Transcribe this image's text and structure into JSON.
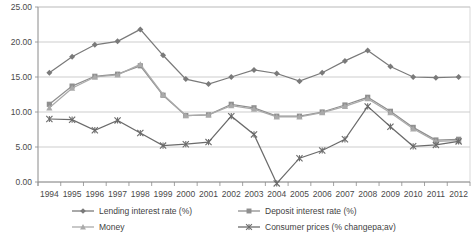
{
  "chart_data": {
    "type": "line",
    "title": "",
    "xlabel": "",
    "ylabel": "",
    "ylim": [
      0,
      25
    ],
    "yticks": [
      0,
      5,
      10,
      15,
      20,
      25
    ],
    "ytick_labels": [
      "0.00",
      "5.00",
      "10.00",
      "15.00",
      "20.00",
      "25.00"
    ],
    "grid": true,
    "legend_position": "bottom",
    "categories": [
      1994,
      1995,
      1996,
      1997,
      1998,
      1999,
      2000,
      2001,
      2002,
      2003,
      2004,
      2005,
      2006,
      2007,
      2008,
      2009,
      2010,
      2011,
      2012
    ],
    "xtick_labels": [
      "1994",
      "1995",
      "1996",
      "1997",
      "1998",
      "1999",
      "2000",
      "2001",
      "2002",
      "2003",
      "2004",
      "2005",
      "2006",
      "2007",
      "2008",
      "2009",
      "2010",
      "2011",
      "2012"
    ],
    "series": [
      {
        "name": "Lending interest rate (%)",
        "color": "#7a7a7a",
        "marker": "diamond",
        "values": [
          15.6,
          17.9,
          19.6,
          20.1,
          21.8,
          18.1,
          14.7,
          14.0,
          15.0,
          16.0,
          15.5,
          14.4,
          15.6,
          17.3,
          18.8,
          16.5,
          15.0,
          14.9,
          15.0
        ]
      },
      {
        "name": "Deposit interest rate (%)",
        "color": "#8f8f8f",
        "marker": "square",
        "values": [
          11.1,
          13.7,
          15.1,
          15.4,
          16.6,
          12.4,
          9.5,
          9.6,
          11.1,
          10.6,
          9.4,
          9.4,
          10.0,
          11.0,
          12.1,
          10.1,
          7.8,
          6.0,
          6.1
        ]
      },
      {
        "name": "Money",
        "color": "#aaaaaa",
        "marker": "triangle",
        "values": [
          10.6,
          13.4,
          15.0,
          15.3,
          16.8,
          12.5,
          9.5,
          9.6,
          10.9,
          10.4,
          9.3,
          9.3,
          9.9,
          10.8,
          11.9,
          9.9,
          7.6,
          5.8,
          5.9
        ]
      },
      {
        "name": "Consumer prices (% changepa;av)",
        "color": "#6b6b6b",
        "marker": "star",
        "values": [
          9.0,
          8.9,
          7.4,
          8.8,
          7.0,
          5.2,
          5.4,
          5.7,
          9.4,
          6.8,
          -0.2,
          3.4,
          4.5,
          6.1,
          10.8,
          7.9,
          5.1,
          5.3,
          5.8
        ]
      }
    ]
  },
  "legend": {
    "items": [
      {
        "label": "Lending interest rate (%)",
        "color": "#7a7a7a",
        "marker": "diamond"
      },
      {
        "label": "Deposit interest rate (%)",
        "color": "#8f8f8f",
        "marker": "square"
      },
      {
        "label": "Money",
        "color": "#aaaaaa",
        "marker": "triangle"
      },
      {
        "label": "Consumer prices (% changepa;av)",
        "color": "#6b6b6b",
        "marker": "star"
      }
    ]
  }
}
